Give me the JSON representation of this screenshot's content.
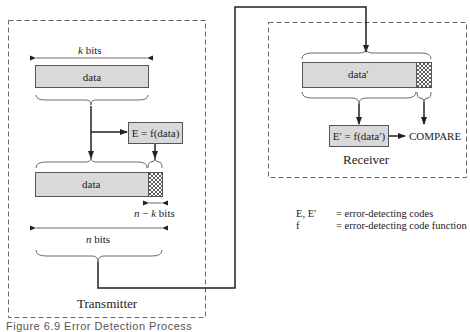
{
  "transmitter": {
    "title": "Transmitter",
    "k_bits_label": "k bits",
    "data_label": "data",
    "e_box_label": "E = f(data)",
    "data2_label": "data",
    "n_minus_k_label": "n − k bits",
    "n_bits_label": "n bits"
  },
  "receiver": {
    "title": "Receiver",
    "data_label": "data′",
    "e_box_label": "E′ = f(data′)",
    "compare_label": "COMPARE"
  },
  "legend": {
    "rows": [
      {
        "key": "E, E′",
        "value": "= error-detecting codes"
      },
      {
        "key": "f",
        "value": "= error-detecting code function"
      }
    ]
  },
  "caption": "Figure 6.9   Error Detection Process",
  "colors": {
    "box_fill": "#d9d9d9",
    "line": "#222222",
    "dash": "#666666"
  }
}
